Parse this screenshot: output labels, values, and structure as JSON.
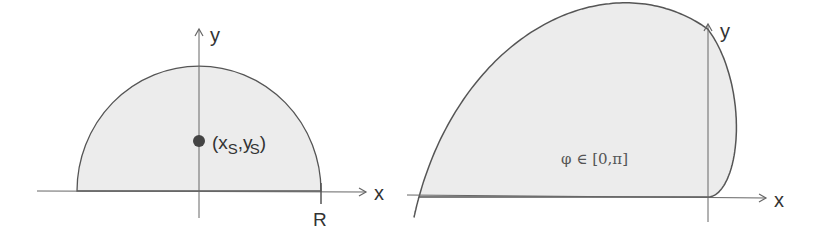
{
  "figure_left": {
    "title": "semicircle",
    "axis_x_label": "x",
    "axis_y_label": "y",
    "radius_label": "R",
    "centroid_label_open": "(x",
    "centroid_sub1": "S",
    "centroid_mid": ",y",
    "centroid_sub2": "S",
    "centroid_label_close": ")"
  },
  "figure_right": {
    "title": "archimedean-spiral-region",
    "axis_x_label": "x",
    "axis_y_label": "y",
    "range_label": "φ ∈ [0,π]"
  },
  "colors": {
    "fill": "#ececec",
    "stroke": "#555555",
    "axis": "#666666",
    "point": "#444444"
  }
}
